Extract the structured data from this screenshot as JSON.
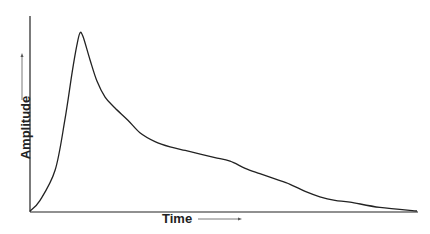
{
  "chart_data": {
    "type": "line",
    "title": "",
    "xlabel": "Time",
    "ylabel": "Amplitude",
    "grid": false,
    "ticks": "none",
    "x": [
      0,
      0.026,
      0.065,
      0.09,
      0.109,
      0.121,
      0.129,
      0.137,
      0.155,
      0.173,
      0.194,
      0.219,
      0.253,
      0.284,
      0.323,
      0.362,
      0.401,
      0.44,
      0.478,
      0.517,
      0.556,
      0.594,
      0.633,
      0.672,
      0.711,
      0.749,
      0.788,
      0.827,
      0.904,
      1.0
    ],
    "series": [
      {
        "name": "Amplitude",
        "values": [
          0,
          0.06,
          0.23,
          0.51,
          0.78,
          0.93,
          1.0,
          0.98,
          0.85,
          0.73,
          0.64,
          0.58,
          0.51,
          0.44,
          0.39,
          0.36,
          0.34,
          0.32,
          0.3,
          0.28,
          0.24,
          0.21,
          0.18,
          0.15,
          0.11,
          0.08,
          0.06,
          0.05,
          0.02,
          0
        ]
      }
    ]
  },
  "labels": {
    "x": "Time",
    "y": "Amplitude"
  }
}
